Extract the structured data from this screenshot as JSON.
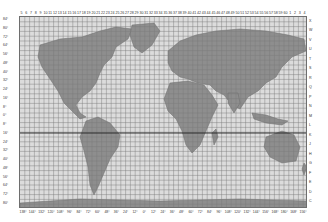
{
  "map": {
    "title": "UTM Grid Zones World Map",
    "zone_numbers_top": [
      "5",
      "6",
      "7",
      "8",
      "9",
      "10",
      "11",
      "12",
      "13",
      "14",
      "15",
      "16",
      "17",
      "18",
      "19",
      "20",
      "21",
      "22",
      "23",
      "24",
      "25",
      "26",
      "27",
      "28",
      "29",
      "30",
      "31",
      "32",
      "33",
      "34",
      "35",
      "36",
      "37",
      "38",
      "39",
      "40",
      "41",
      "42",
      "43",
      "44",
      "45",
      "46",
      "47",
      "48",
      "49",
      "50",
      "51",
      "52",
      "53",
      "54",
      "55",
      "56",
      "57",
      "58",
      "59",
      "60",
      "1",
      "2",
      "3",
      "4"
    ],
    "longitude_labels_bottom": [
      "138°",
      "144°",
      "132°",
      "120°",
      "108°",
      "96°",
      "84°",
      "72°",
      "60°",
      "48°",
      "36°",
      "24°",
      "12°",
      "0°",
      "12°",
      "24°",
      "36°",
      "48°",
      "60°",
      "72°",
      "84°",
      "96°",
      "108°",
      "120°",
      "132°",
      "144°",
      "156°",
      "168°",
      "180°",
      "168°",
      "156°"
    ],
    "latitude_labels_left": [
      "84°",
      "80°",
      "72°",
      "64°",
      "56°",
      "48°",
      "40°",
      "32°",
      "24°",
      "16°",
      "8°",
      "0°",
      "8°",
      "16°",
      "24°",
      "32°",
      "40°",
      "48°",
      "56°",
      "64°",
      "72°",
      "80°"
    ],
    "latitude_bands_right": [
      "X",
      "W",
      "V",
      "U",
      "T",
      "S",
      "R",
      "Q",
      "P",
      "N",
      "M",
      "L",
      "K",
      "J",
      "H",
      "G",
      "F",
      "E",
      "D",
      "C"
    ],
    "colors": {
      "land": "#8a8a8a",
      "ocean": "#dcdcdc",
      "grid": "#7a7a7a",
      "equator": "#222222"
    }
  }
}
